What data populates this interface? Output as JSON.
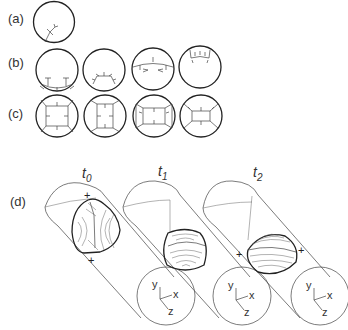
{
  "figure": {
    "panels": [
      {
        "id": "a",
        "label": "(a)",
        "circles": 1
      },
      {
        "id": "b",
        "label": "(b)",
        "circles": 4
      },
      {
        "id": "c",
        "label": "(c)",
        "circles": 4
      },
      {
        "id": "d",
        "label": "(d)",
        "cylinders": 3
      }
    ],
    "time_labels": [
      {
        "base": "t",
        "sub": "0"
      },
      {
        "base": "t",
        "sub": "1"
      },
      {
        "base": "t",
        "sub": "2"
      }
    ],
    "axis_labels": {
      "x": "x",
      "y": "y",
      "z": "z"
    },
    "plus_sign": "+"
  }
}
